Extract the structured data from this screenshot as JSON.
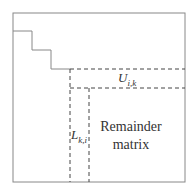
{
  "diagram": {
    "type": "matrix-block-decomposition",
    "labels": {
      "u_block": {
        "base": "U",
        "sub": "i,k"
      },
      "l_block": {
        "base": "L",
        "sub": "k,i"
      },
      "remainder_line1": "Remainder",
      "remainder_line2": "matrix"
    },
    "colors": {
      "solid_line": "#888888",
      "dashed_line": "#444444",
      "text": "#333333"
    }
  }
}
